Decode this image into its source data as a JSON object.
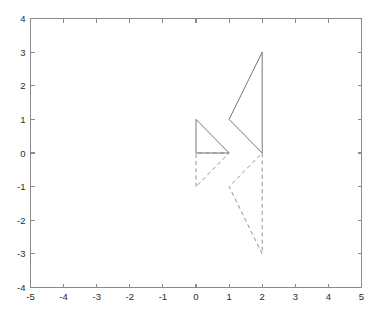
{
  "figure": {
    "background_color": "#ffffff",
    "axis_color": "#8a8a8a",
    "solid_line_color": "#6f6f6f",
    "dashed_line_color": "#8b8b8b"
  },
  "chart_data": {
    "type": "line",
    "title": "",
    "xlabel": "",
    "ylabel": "",
    "xlim": [
      -5,
      5
    ],
    "ylim": [
      -4,
      4
    ],
    "xticks": [
      -5,
      -4,
      -3,
      -2,
      -1,
      0,
      1,
      2,
      3,
      4,
      5
    ],
    "yticks": [
      -4,
      -3,
      -2,
      -1,
      0,
      1,
      2,
      3,
      4
    ],
    "xticklabels": [
      "-5",
      "-4",
      "-3",
      "-2",
      "-1",
      "0",
      "1",
      "2",
      "3",
      "4",
      "5"
    ],
    "yticklabels": [
      "-4",
      "-3",
      "-2",
      "-1",
      "0",
      "1",
      "2",
      "3",
      "4"
    ],
    "grid": false,
    "legend": null,
    "aspect": "equal-box",
    "series": [
      {
        "name": "small-triangle-solid",
        "style": "solid",
        "closed": true,
        "color": "#6f6f6f",
        "points": [
          [
            0,
            1
          ],
          [
            0,
            0
          ],
          [
            1,
            0
          ],
          [
            0,
            1
          ]
        ]
      },
      {
        "name": "large-triangle-solid",
        "style": "solid",
        "closed": true,
        "color": "#6f6f6f",
        "points": [
          [
            2,
            3
          ],
          [
            1,
            1
          ],
          [
            2,
            0
          ],
          [
            2,
            3
          ]
        ]
      },
      {
        "name": "small-triangle-dashed",
        "style": "dashed",
        "closed": true,
        "color": "#8b8b8b",
        "points": [
          [
            0,
            -1
          ],
          [
            0,
            0
          ],
          [
            1,
            0
          ],
          [
            0,
            -1
          ]
        ]
      },
      {
        "name": "large-triangle-dashed",
        "style": "dashed",
        "closed": true,
        "color": "#8b8b8b",
        "points": [
          [
            2,
            -3
          ],
          [
            1,
            -1
          ],
          [
            2,
            0
          ],
          [
            2,
            -3
          ]
        ]
      }
    ]
  }
}
